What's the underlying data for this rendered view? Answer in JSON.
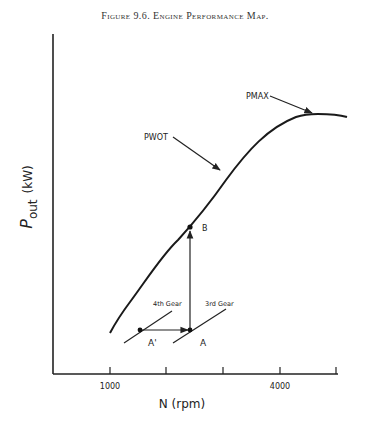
{
  "figure_title": "Figure 9.6. Engine Performance Map.",
  "chart_data": {
    "type": "line",
    "title": "Figure 9.6. Engine Performance Map.",
    "xlabel": "N (rpm)",
    "ylabel_main": "P",
    "ylabel_sub": "out",
    "ylabel_unit": "(kW)",
    "x_ticks": [
      {
        "value": 1000,
        "label": "1000"
      },
      {
        "value": 2000,
        "label": ""
      },
      {
        "value": 3000,
        "label": ""
      },
      {
        "value": 4000,
        "label": "4000"
      },
      {
        "value": 5000,
        "label": ""
      }
    ],
    "xlim": [
      0,
      5000
    ],
    "ylim": [
      0,
      100
    ],
    "grid": false,
    "series": [
      {
        "name": "PWOT",
        "x": [
          1000,
          1300,
          1700,
          2200,
          2700,
          3200,
          3700,
          4200,
          4600,
          4800,
          5200
        ],
        "y": [
          11,
          19,
          32,
          47,
          60,
          72,
          83,
          91,
          94,
          94,
          93
        ]
      }
    ],
    "points": [
      {
        "name": "A",
        "x": 2400,
        "y": 12
      },
      {
        "name": "A'",
        "x": 1500,
        "y": 12
      },
      {
        "name": "B",
        "x": 2400,
        "y": 42
      }
    ],
    "gear_lines": [
      {
        "label": "4th Gear",
        "from": [
          1000,
          4
        ],
        "to": [
          1800,
          22
        ]
      },
      {
        "label": "3rd Gear",
        "from": [
          2000,
          4
        ],
        "to": [
          2800,
          22
        ]
      }
    ],
    "annotations": [
      {
        "text": "PMAX",
        "arrow_to": [
          4600,
          94
        ]
      },
      {
        "text": "PWOT",
        "arrow_to": [
          3100,
          70
        ]
      },
      {
        "text": "B"
      },
      {
        "text": "A"
      },
      {
        "text": "A'"
      },
      {
        "text": "4th Gear"
      },
      {
        "text": "3rd Gear"
      }
    ]
  }
}
